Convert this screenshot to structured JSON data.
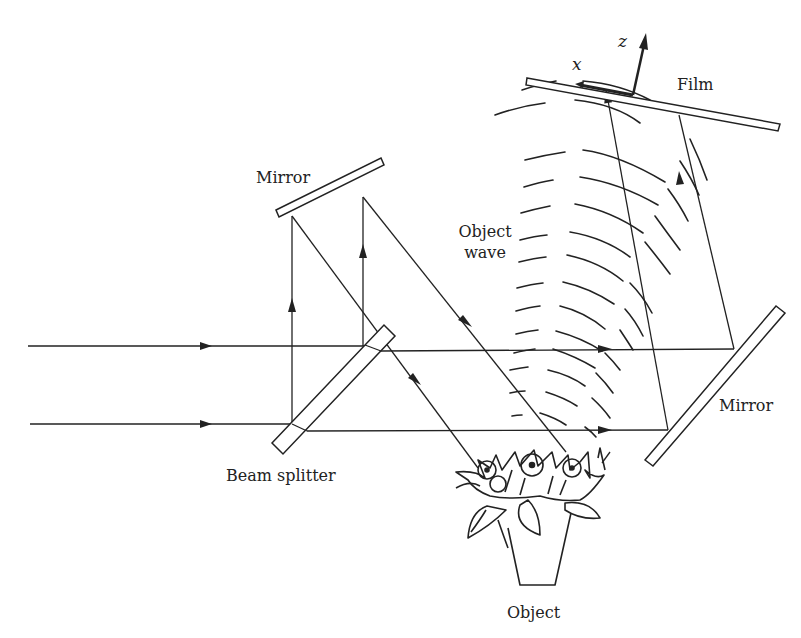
{
  "diagram": {
    "labels": {
      "film": "Film",
      "mirror_top": "Mirror",
      "mirror_right": "Mirror",
      "beam_splitter": "Beam splitter",
      "object_wave_line1": "Object",
      "object_wave_line2": "wave",
      "object": "Object",
      "axis_x": "x",
      "axis_z": "z"
    },
    "colors": {
      "ink": "#222222",
      "background": "#ffffff"
    },
    "components": [
      {
        "name": "film",
        "type": "plate"
      },
      {
        "name": "mirror-top",
        "type": "plate"
      },
      {
        "name": "mirror-right",
        "type": "plate"
      },
      {
        "name": "beam-splitter",
        "type": "plate"
      },
      {
        "name": "object-flower-vase",
        "type": "object"
      }
    ],
    "beams": [
      {
        "name": "incoming-beam-upper",
        "direction": "right"
      },
      {
        "name": "incoming-beam-lower",
        "direction": "right"
      },
      {
        "name": "reference-beam",
        "path": "beam splitter -> top mirror -> object"
      },
      {
        "name": "object-wave",
        "path": "object -> film"
      },
      {
        "name": "mirror-beam",
        "path": "beam splitter -> right mirror -> film"
      }
    ]
  }
}
